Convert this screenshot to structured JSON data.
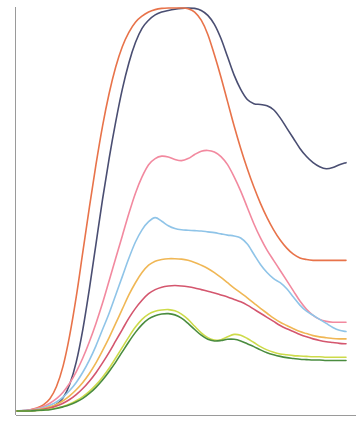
{
  "chart_data": {
    "type": "line",
    "title": "",
    "subtitle": "",
    "xlabel": "",
    "ylabel": "",
    "grid": false,
    "legend": "none",
    "axes": {
      "left_spine": true,
      "bottom_spine": true,
      "top_spine": false,
      "right_spine": false,
      "tick_labels_x": [],
      "tick_labels_y": [],
      "xlim": [
        0,
        100
      ],
      "ylim": [
        0,
        100
      ]
    },
    "x": [
      0,
      2,
      4,
      6,
      8,
      10,
      12,
      14,
      16,
      18,
      20,
      22,
      24,
      26,
      28,
      30,
      32,
      34,
      36,
      38,
      40,
      42,
      44,
      46,
      48,
      50,
      52,
      54,
      56,
      58,
      60,
      62,
      64,
      66,
      68,
      70,
      72,
      74,
      76,
      78,
      80,
      82,
      84,
      86,
      88,
      90,
      92,
      94,
      96,
      98,
      100
    ],
    "series": [
      {
        "name": "series-navy",
        "color": "#4A4E72",
        "values": [
          1.0,
          1.0,
          1.1,
          1.2,
          1.4,
          1.8,
          2.6,
          4.2,
          7.5,
          13.0,
          21.0,
          31.0,
          42.0,
          53.0,
          63.0,
          72.0,
          80.0,
          86.5,
          91.5,
          95.0,
          97.0,
          98.3,
          99.0,
          99.4,
          99.7,
          99.9,
          100.0,
          99.9,
          99.4,
          98.2,
          96.0,
          92.5,
          88.0,
          83.5,
          80.0,
          77.5,
          76.5,
          76.3,
          76.0,
          75.0,
          73.0,
          70.5,
          68.0,
          65.5,
          63.5,
          62.0,
          61.0,
          60.5,
          60.8,
          61.5,
          62.0
        ]
      },
      {
        "name": "series-orange",
        "color": "#E8734A",
        "values": [
          1.0,
          1.1,
          1.3,
          1.7,
          2.5,
          4.0,
          7.0,
          12.0,
          19.5,
          29.0,
          40.0,
          51.0,
          61.5,
          71.0,
          79.0,
          85.5,
          90.5,
          94.0,
          96.5,
          98.0,
          99.0,
          99.6,
          99.9,
          100.0,
          100.0,
          100.0,
          99.8,
          99.0,
          97.0,
          93.5,
          88.5,
          83.0,
          77.0,
          71.0,
          65.5,
          60.5,
          56.0,
          52.0,
          48.5,
          45.5,
          43.0,
          41.0,
          39.5,
          38.6,
          38.2,
          38.0,
          38.0,
          38.0,
          38.0,
          38.0,
          38.0
        ]
      },
      {
        "name": "series-pink",
        "color": "#F2899F",
        "values": [
          1.0,
          1.1,
          1.3,
          1.6,
          2.1,
          2.9,
          4.0,
          5.6,
          7.8,
          10.6,
          14.0,
          18.0,
          22.5,
          27.5,
          33.0,
          38.5,
          44.0,
          49.5,
          54.5,
          58.5,
          61.5,
          63.0,
          63.6,
          63.4,
          62.8,
          62.5,
          63.0,
          64.0,
          64.8,
          65.0,
          64.6,
          63.5,
          61.5,
          58.5,
          55.0,
          51.0,
          47.0,
          43.5,
          40.5,
          38.0,
          35.5,
          33.0,
          30.5,
          28.0,
          26.0,
          24.5,
          23.5,
          23.0,
          22.8,
          22.8,
          22.8
        ]
      },
      {
        "name": "series-lightblue",
        "color": "#8FC4E8",
        "values": [
          1.0,
          1.1,
          1.2,
          1.4,
          1.8,
          2.4,
          3.2,
          4.4,
          6.0,
          8.0,
          10.5,
          13.5,
          17.0,
          21.0,
          25.0,
          29.5,
          34.0,
          38.5,
          42.5,
          45.5,
          47.5,
          48.5,
          47.6,
          46.5,
          45.8,
          45.5,
          45.4,
          45.3,
          45.2,
          45.0,
          44.8,
          44.5,
          44.2,
          44.0,
          43.5,
          42.0,
          39.5,
          37.0,
          35.0,
          33.5,
          32.5,
          31.0,
          29.0,
          27.0,
          25.5,
          24.5,
          23.5,
          22.5,
          21.5,
          20.8,
          20.5
        ]
      },
      {
        "name": "series-gold",
        "color": "#F0B755",
        "values": [
          1.0,
          1.0,
          1.1,
          1.3,
          1.6,
          2.0,
          2.6,
          3.5,
          4.7,
          6.2,
          8.0,
          10.2,
          12.8,
          15.8,
          19.0,
          22.5,
          26.0,
          29.5,
          32.5,
          35.0,
          36.8,
          37.8,
          38.2,
          38.4,
          38.4,
          38.3,
          38.0,
          37.5,
          36.8,
          36.0,
          35.0,
          33.8,
          32.5,
          31.2,
          30.0,
          28.8,
          27.5,
          26.2,
          25.0,
          23.8,
          22.8,
          22.0,
          21.2,
          20.5,
          20.0,
          19.5,
          19.2,
          19.0,
          18.8,
          18.7,
          18.7
        ]
      },
      {
        "name": "series-crimson",
        "color": "#D4566E",
        "values": [
          1.0,
          1.0,
          1.1,
          1.2,
          1.4,
          1.7,
          2.2,
          2.9,
          3.8,
          5.0,
          6.5,
          8.3,
          10.4,
          12.8,
          15.4,
          18.2,
          21.0,
          23.8,
          26.2,
          28.2,
          29.8,
          30.8,
          31.4,
          31.7,
          31.8,
          31.7,
          31.5,
          31.2,
          30.8,
          30.4,
          30.0,
          29.5,
          29.0,
          28.4,
          27.8,
          27.0,
          26.0,
          25.0,
          24.0,
          23.0,
          22.0,
          21.2,
          20.5,
          19.8,
          19.2,
          18.7,
          18.3,
          18.0,
          17.8,
          17.6,
          17.5
        ]
      },
      {
        "name": "series-yellowgreen",
        "color": "#CDDB4A",
        "values": [
          1.0,
          1.0,
          1.0,
          1.1,
          1.2,
          1.4,
          1.7,
          2.1,
          2.7,
          3.5,
          4.5,
          5.8,
          7.4,
          9.3,
          11.5,
          14.0,
          16.6,
          19.2,
          21.6,
          23.5,
          24.8,
          25.5,
          25.8,
          25.9,
          25.6,
          24.8,
          23.5,
          21.8,
          20.2,
          19.0,
          18.4,
          18.5,
          19.2,
          19.8,
          19.6,
          18.8,
          17.8,
          16.8,
          16.0,
          15.4,
          15.0,
          14.8,
          14.6,
          14.5,
          14.4,
          14.3,
          14.3,
          14.2,
          14.2,
          14.2,
          14.2
        ]
      },
      {
        "name": "series-darkgreen",
        "color": "#4A8C3F",
        "values": [
          1.0,
          1.0,
          1.0,
          1.1,
          1.2,
          1.3,
          1.6,
          2.0,
          2.5,
          3.2,
          4.1,
          5.3,
          6.8,
          8.6,
          10.7,
          13.0,
          15.5,
          18.0,
          20.3,
          22.2,
          23.6,
          24.4,
          24.8,
          24.9,
          24.6,
          23.8,
          22.5,
          21.0,
          19.6,
          18.6,
          18.2,
          18.3,
          18.6,
          18.6,
          18.2,
          17.5,
          16.8,
          16.0,
          15.3,
          14.8,
          14.4,
          14.1,
          13.9,
          13.7,
          13.6,
          13.5,
          13.5,
          13.4,
          13.4,
          13.4,
          13.4
        ]
      }
    ]
  },
  "plot": {
    "background_color": "#FFFFFF",
    "axis_color": "#9A9A9A",
    "left_px": 17,
    "right_px": 346,
    "top_px": 8,
    "bottom_px": 415,
    "line_width": 1.6
  }
}
